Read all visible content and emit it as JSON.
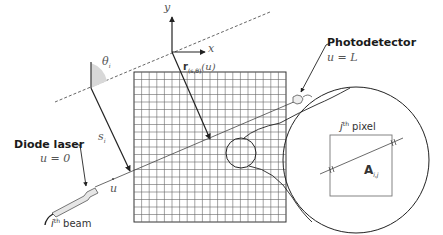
{
  "diagram": {
    "type": "laser-absorption-tomography-schematic",
    "colors": {
      "line": "#222222",
      "grid": "#555555",
      "dashed": "#555555",
      "beam": "#444444",
      "angle_fill": "#d8d8d8",
      "laser_fill": "#e6e6e6"
    },
    "grid": {
      "x": 134,
      "y": 72,
      "size": 152,
      "cells": 20
    },
    "labels": {
      "axis_y": "y",
      "axis_x": "x",
      "r_vector": "r",
      "r_subscript": "(s,θ)",
      "r_arg": "(u)",
      "theta": "θ",
      "theta_sub": "i",
      "s": "s",
      "s_sub": "i",
      "u": "u",
      "photodetector": "Photodetector",
      "photodetector_u": "u = L",
      "diode_laser": "Diode laser",
      "diode_laser_u": "u = 0",
      "beam_prefix": "i",
      "beam_sup": "th",
      "beam_label": " beam",
      "pixel_prefix": "j",
      "pixel_sup": "th",
      "pixel_label": " pixel",
      "A": "A",
      "A_sub": "i,j"
    }
  }
}
